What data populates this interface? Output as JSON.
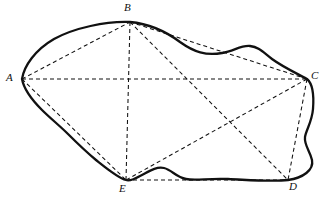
{
  "figure": {
    "canvas": {
      "width": 324,
      "height": 202,
      "background": "#ffffff"
    },
    "stroke_colors": {
      "outline": "#111111",
      "chord": "#111111",
      "label": "#111111"
    },
    "vertices": [
      {
        "id": "A",
        "label": "A",
        "x": 22,
        "y": 79,
        "label_x": 6,
        "label_y": 73
      },
      {
        "id": "B",
        "label": "B",
        "x": 130,
        "y": 22,
        "label_x": 124,
        "label_y": 3
      },
      {
        "id": "C",
        "label": "C",
        "x": 307,
        "y": 79,
        "label_x": 311,
        "label_y": 71
      },
      {
        "id": "D",
        "label": "D",
        "x": 288,
        "y": 180,
        "label_x": 290,
        "label_y": 181
      },
      {
        "id": "E",
        "label": "E",
        "x": 126,
        "y": 180,
        "label_x": 120,
        "label_y": 183
      }
    ],
    "chords": [
      {
        "id": "A-C",
        "from": "A",
        "to": "C",
        "style": "dashed"
      },
      {
        "id": "B-E",
        "from": "B",
        "to": "E",
        "style": "dashed"
      },
      {
        "id": "A-B",
        "from": "A",
        "to": "B",
        "style": "dashed"
      },
      {
        "id": "B-C",
        "from": "B",
        "to": "C",
        "style": "dashed"
      },
      {
        "id": "A-E",
        "from": "A",
        "to": "E",
        "style": "dashed"
      },
      {
        "id": "E-D",
        "from": "E",
        "to": "D",
        "style": "dashed"
      },
      {
        "id": "C-D",
        "from": "C",
        "to": "D",
        "style": "dashed"
      },
      {
        "id": "B-D",
        "from": "B",
        "to": "D",
        "style": "dashed"
      },
      {
        "id": "C-E",
        "from": "C",
        "to": "E",
        "style": "dashed"
      }
    ],
    "outline_path": "M 22 79 C 24 66 35 50 54 39 C 74 28 106 21 130 22 C 152 24 168 33 180 42 C 194 52 206 56 222 53 C 234 51 241 45 250 46 C 259 47 264 53 272 59 C 283 67 296 73 307 79 C 313 84 314 96 313 109 C 312 122 306 130 305 137 C 304 145 310 151 312 160 C 314 170 303 178 288 180 C 272 182 250 180 228 179 C 208 178 196 181 186 179 C 176 177 172 170 164 168 C 156 166 148 172 140 176 C 133 180 129 181 126 180 C 118 178 106 168 96 160 C 84 150 76 142 68 134 C 60 126 50 118 42 110 C 32 100 24 90 22 79 Z",
    "label_font": {
      "size_px": 11,
      "style": "italic"
    }
  }
}
